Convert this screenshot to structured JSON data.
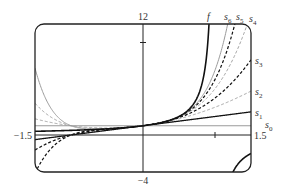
{
  "chart_data": {
    "type": "line",
    "title": "",
    "xlabel": "",
    "ylabel": "",
    "xlim": [
      -1.5,
      1.5
    ],
    "ylim": [
      -4,
      12
    ],
    "grid": false,
    "axis_labels": {
      "x_min": "−1.5",
      "x_max": "1.5",
      "y_min": "−4",
      "y_max": "12"
    },
    "ticks": {
      "x": [
        1
      ],
      "y": [
        10
      ]
    },
    "function": "f(x) = 1/(1 - x)",
    "series": [
      {
        "name": "f",
        "label": "f",
        "expr": "1/(1-x)",
        "style": "solid",
        "color": "#111111",
        "width": 1.6
      },
      {
        "name": "s0",
        "label": "s",
        "sub": "0",
        "degree": 0,
        "style": "solid",
        "color": "#9a9a9a",
        "width": 1.1
      },
      {
        "name": "s1",
        "label": "s",
        "sub": "1",
        "degree": 1,
        "style": "solid",
        "color": "#111111",
        "width": 1.3
      },
      {
        "name": "s2",
        "label": "s",
        "sub": "2",
        "degree": 2,
        "style": "dashed",
        "color": "#a0a0a0",
        "width": 1.0
      },
      {
        "name": "s3",
        "label": "s",
        "sub": "3",
        "degree": 3,
        "style": "dashed",
        "color": "#111111",
        "width": 1.2
      },
      {
        "name": "s4",
        "label": "s",
        "sub": "4",
        "degree": 4,
        "style": "dashed",
        "color": "#a0a0a0",
        "width": 1.0
      },
      {
        "name": "s5",
        "label": "s",
        "sub": "5",
        "degree": 5,
        "style": "dashed",
        "color": "#111111",
        "width": 1.2
      },
      {
        "name": "s6",
        "label": "s",
        "sub": "6",
        "degree": 6,
        "style": "solid",
        "color": "#9a9a9a",
        "width": 1.0
      }
    ],
    "label_positions": {
      "f": [
        207,
        20
      ],
      "s6": [
        224,
        20
      ],
      "s5": [
        236,
        20
      ],
      "s4": [
        249,
        22
      ],
      "s3": [
        255,
        64
      ],
      "s2": [
        255,
        95
      ],
      "s1": [
        255,
        116
      ],
      "s0": [
        265,
        128
      ]
    }
  }
}
